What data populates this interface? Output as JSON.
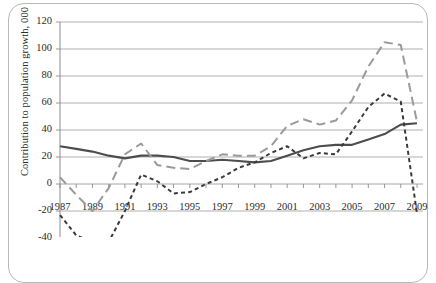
{
  "chart_data": {
    "type": "line",
    "title": "",
    "subtitle": "",
    "xlabel": "",
    "ylabel": "Contribution to population growth, 000",
    "xlim": [
      1987,
      2009
    ],
    "ylim": [
      -40,
      120
    ],
    "y_ticks": [
      120,
      100,
      80,
      60,
      40,
      20,
      0,
      -20,
      -40
    ],
    "x_ticks": [
      1987,
      1989,
      1991,
      1993,
      1995,
      1997,
      1999,
      2001,
      2003,
      2005,
      2007,
      2009
    ],
    "x_tick_labels": [
      "1987",
      "1989",
      "1991",
      "1993",
      "1995",
      "1997",
      "1999",
      "2001",
      "2003",
      "2005",
      "2007",
      "2009"
    ],
    "x_all_years": [
      1987,
      1988,
      1989,
      1990,
      1991,
      1992,
      1993,
      1994,
      1995,
      1996,
      1997,
      1998,
      1999,
      2000,
      2001,
      2002,
      2003,
      2004,
      2005,
      2006,
      2007,
      2008,
      2009
    ],
    "grid": true,
    "grid_axis": "y",
    "grid_color": "#a6a6a6",
    "legend": "none",
    "axis_color": "#8c8c8c",
    "series": [
      {
        "name": "natural-increase-solid",
        "style": "solid",
        "color": "#4d4d4d",
        "values": [
          28,
          26,
          24,
          21,
          19,
          21,
          21,
          20,
          17,
          17,
          18,
          17,
          16,
          17,
          21,
          25,
          28,
          29,
          29,
          33,
          37,
          44,
          45
        ]
      },
      {
        "name": "total-growth-long-dash",
        "style": "long-dash",
        "color": "#9a9a9a",
        "values": [
          5,
          -8,
          -20,
          -3,
          22,
          30,
          14,
          12,
          11,
          17,
          22,
          21,
          21,
          28,
          43,
          48,
          44,
          47,
          62,
          87,
          105,
          103,
          46
        ]
      },
      {
        "name": "net-migration-short-dash",
        "style": "short-dash",
        "color": "#3a3a3a",
        "values": [
          -23,
          -38,
          -43,
          -43,
          -20,
          7,
          2,
          -7,
          -6,
          0,
          5,
          12,
          16,
          23,
          28,
          19,
          23,
          22,
          39,
          57,
          67,
          61,
          -22
        ]
      }
    ]
  },
  "axes": {
    "y_axis_title": "Contribution to population growth, 000"
  }
}
